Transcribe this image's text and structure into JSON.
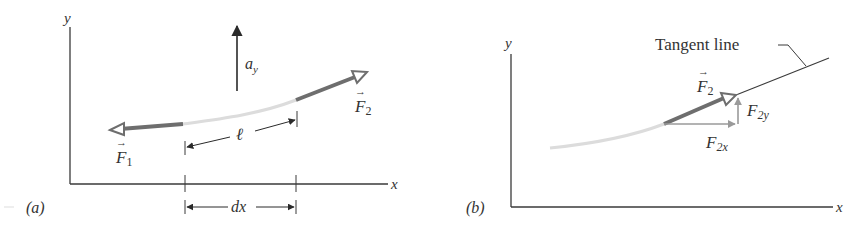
{
  "colors": {
    "axis": "#3a3a3a",
    "string_light": "#d9d9d9",
    "force_vector": "#6e6e6e",
    "component_vector": "#9a9a9a",
    "text": "#333333",
    "background": "#ffffff"
  },
  "panel_a": {
    "label": "(a)",
    "axes": {
      "x_label": "x",
      "y_label": "y"
    },
    "acceleration": {
      "symbol": "a",
      "subscript": "y"
    },
    "force_left": {
      "symbol": "F",
      "subscript": "1",
      "vector_arrow": "→"
    },
    "force_right": {
      "symbol": "F",
      "subscript": "2",
      "vector_arrow": "→"
    },
    "segment_length": {
      "symbol": "ℓ"
    },
    "width_marker": {
      "symbol": "dx"
    }
  },
  "panel_b": {
    "label": "(b)",
    "axes": {
      "x_label": "x",
      "y_label": "y"
    },
    "tangent_line_label": "Tangent line",
    "force": {
      "symbol": "F",
      "subscript": "2",
      "vector_arrow": "→"
    },
    "component_y": {
      "symbol": "F",
      "subscript": "2y"
    },
    "component_x": {
      "symbol": "F",
      "subscript": "2x"
    }
  }
}
